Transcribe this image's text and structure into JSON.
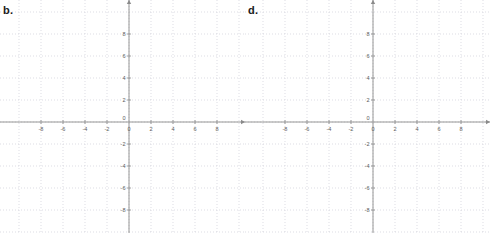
{
  "page": {
    "background": "#ffffff",
    "width": 490,
    "height": 233
  },
  "panels": [
    {
      "label": "b.",
      "name": "graph-b",
      "label_x": 3,
      "label_y": 4
    },
    {
      "label": "d.",
      "name": "graph-d",
      "label_x": 3,
      "label_y": 4
    }
  ],
  "style": {
    "axis_color": "#8a8a8a",
    "grid_color": "#cfcfd8",
    "curve_color": "#6b6b6b",
    "label_color": "#5d5d5d",
    "grid_dash": "1,2"
  },
  "chart_data": [
    {
      "type": "line",
      "title": "b.",
      "xlabel": "",
      "ylabel": "",
      "xlim": [
        -9.8,
        9.8
      ],
      "ylim": [
        -9.5,
        9.5
      ],
      "grid": true,
      "grid_step": 2,
      "legend": "none",
      "xticks": [
        -8,
        -6,
        -4,
        -2,
        0,
        2,
        4,
        6,
        8
      ],
      "yticks": [
        -8,
        -6,
        -4,
        -2,
        0,
        2,
        4,
        6,
        8
      ],
      "xtick_labels": [
        "-8",
        "-6",
        "-4",
        "-2",
        "0",
        "2",
        "4",
        "6",
        "8"
      ],
      "ytick_labels": [
        "-8",
        "-6",
        "-4",
        "-2",
        "0",
        "2",
        "4",
        "6",
        "8"
      ],
      "series": [
        {
          "name": "parabola-b",
          "equation": "y = (x + 4)^2 - 3",
          "vertex": [
            -4,
            -3
          ],
          "roots": [
            -5.732,
            -2.268
          ],
          "x": [
            -7.5,
            -7.0,
            -6.5,
            -6.0,
            -5.5,
            -5.0,
            -4.5,
            -4.0,
            -3.5,
            -3.0,
            -2.5,
            -2.0,
            -1.5,
            -1.0,
            -0.5,
            -0.1
          ],
          "values": [
            9.25,
            6.0,
            3.25,
            1.0,
            -0.75,
            -2.0,
            -2.75,
            -3.0,
            -2.75,
            -2.0,
            -0.75,
            1.0,
            3.25,
            6.0,
            9.25,
            12.21
          ]
        }
      ]
    },
    {
      "type": "line",
      "title": "d.",
      "xlabel": "",
      "ylabel": "",
      "xlim": [
        -9.8,
        9.8
      ],
      "ylim": [
        -9.5,
        9.5
      ],
      "grid": true,
      "grid_step": 2,
      "legend": "none",
      "xticks": [
        -8,
        -6,
        -4,
        -2,
        0,
        2,
        4,
        6,
        8
      ],
      "yticks": [
        -8,
        -6,
        -4,
        -2,
        0,
        2,
        4,
        6,
        8
      ],
      "xtick_labels": [
        "-8",
        "-6",
        "-4",
        "-2",
        "0",
        "2",
        "4",
        "6",
        "8"
      ],
      "ytick_labels": [
        "-8",
        "-6",
        "-4",
        "-2",
        "0",
        "2",
        "4",
        "6",
        "8"
      ],
      "series": [
        {
          "name": "parabola-d",
          "equation": "y = (x - 4)^2 - 3",
          "vertex": [
            4,
            -3
          ],
          "roots": [
            2.268,
            5.732
          ],
          "x": [
            0.1,
            0.5,
            1.0,
            1.5,
            2.0,
            2.5,
            3.0,
            3.5,
            4.0,
            4.5,
            5.0,
            5.5,
            6.0,
            6.5,
            7.0,
            7.5
          ],
          "values": [
            12.21,
            9.25,
            6.0,
            3.25,
            1.0,
            -0.75,
            -2.0,
            -2.75,
            -3.0,
            -2.75,
            -2.0,
            -0.75,
            1.0,
            3.25,
            6.0,
            9.25
          ]
        }
      ]
    }
  ]
}
